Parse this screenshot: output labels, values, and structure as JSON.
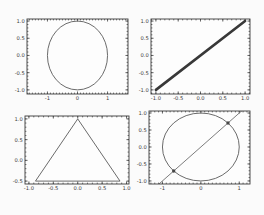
{
  "figure": {
    "width": 264,
    "height": 215,
    "background": "#fbfbfb",
    "axes_background": "#fdfdfd"
  },
  "style": {
    "spine_color": "#3b3b3b",
    "tick_color": "#3b3b3b",
    "tick_label_color": "#3a3a3a",
    "tick_font_size": 5.2,
    "major_tick_len": 2.6,
    "minor_tick_len": 1.4
  },
  "chart_data": [
    {
      "id": "top-left",
      "type": "line",
      "title": "",
      "xlabel": "",
      "ylabel": "",
      "box": {
        "left": 27,
        "top": 19,
        "width": 101,
        "height": 75
      },
      "xlim": [
        -1.68,
        1.68
      ],
      "ylim": [
        -1.12,
        1.06
      ],
      "xticks": {
        "values": [
          -1,
          0,
          1
        ],
        "labels": [
          "-1",
          "0",
          "1"
        ]
      },
      "yticks": {
        "values": [
          1.0,
          0.5,
          0.0,
          -0.5,
          -1.0
        ],
        "labels": [
          "1.0",
          "0.5",
          "0.0",
          "-0.5",
          "-1.0"
        ]
      },
      "minor_step": 0.1,
      "grid": false,
      "elements": [
        {
          "kind": "circle",
          "name": "unit-circle",
          "cx": 0,
          "cy": 0,
          "r": 1,
          "stroke": "#5a5a5a",
          "width": 0.9
        }
      ]
    },
    {
      "id": "top-right",
      "type": "line",
      "title": "",
      "xlabel": "",
      "ylabel": "",
      "box": {
        "left": 151,
        "top": 19,
        "width": 99,
        "height": 75
      },
      "xlim": [
        -1.11,
        1.11
      ],
      "ylim": [
        -1.12,
        1.06
      ],
      "xticks": {
        "values": [
          -1.0,
          -0.5,
          0.0,
          0.5,
          1.0
        ],
        "labels": [
          "-1.0",
          "-0.5",
          "0.0",
          "0.5",
          "1.0"
        ]
      },
      "yticks": {
        "values": [
          1.0,
          0.5,
          0.0,
          -0.5,
          -1.0
        ],
        "labels": [
          "1.0",
          "0.5",
          "0.0",
          "-0.5",
          "-1.0"
        ]
      },
      "minor_step": 0.1,
      "grid": false,
      "elements": [
        {
          "kind": "line",
          "name": "diagonal-line",
          "x1": -1,
          "y1": -1,
          "x2": 1,
          "y2": 1,
          "stroke": "#383838",
          "width": 2.6
        }
      ]
    },
    {
      "id": "bottom-left",
      "type": "line",
      "title": "",
      "xlabel": "",
      "ylabel": "",
      "box": {
        "left": 25,
        "top": 116,
        "width": 104,
        "height": 68
      },
      "xlim": [
        -1.08,
        1.05
      ],
      "ylim": [
        -0.57,
        1.07
      ],
      "xticks": {
        "values": [
          -1.0,
          -0.5,
          0.0,
          0.5,
          1.0
        ],
        "labels": [
          "-1.0",
          "-0.5",
          "0.0",
          "0.5",
          "1.0"
        ]
      },
      "yticks": {
        "values": [
          1.0,
          0.5,
          0.0,
          -0.5
        ],
        "labels": [
          "1.0",
          "0.5",
          "0.0",
          "-0.5"
        ]
      },
      "minor_step": 0.1,
      "grid": false,
      "elements": [
        {
          "kind": "polygon",
          "name": "triangle",
          "points": [
            [
              -0.866,
              -0.5
            ],
            [
              0.866,
              -0.5
            ],
            [
              0,
              1
            ]
          ],
          "stroke": "#5a5a5a",
          "width": 0.9
        }
      ]
    },
    {
      "id": "bottom-right",
      "type": "line",
      "title": "",
      "xlabel": "",
      "ylabel": "",
      "box": {
        "left": 149,
        "top": 111,
        "width": 101,
        "height": 73
      },
      "xlim": [
        -1.35,
        1.28
      ],
      "ylim": [
        -1.09,
        1.06
      ],
      "xticks": {
        "values": [
          -1,
          0,
          1
        ],
        "labels": [
          "-1",
          "0",
          "1"
        ]
      },
      "yticks": {
        "values": [
          1.0,
          0.5,
          0.0,
          -0.5,
          -1.0
        ],
        "labels": [
          "1.0",
          "0.5",
          "0.0",
          "-0.5",
          "-1.0"
        ]
      },
      "minor_step": 0.1,
      "grid": false,
      "elements": [
        {
          "kind": "circle",
          "name": "unit-circle",
          "cx": 0,
          "cy": 0,
          "r": 1,
          "stroke": "#5a5a5a",
          "width": 0.9
        },
        {
          "kind": "line",
          "name": "chord-line",
          "x1": -1.2,
          "y1": -1.2,
          "x2": 1.3,
          "y2": 1.3,
          "stroke": "#6e6e6e",
          "width": 0.9
        },
        {
          "kind": "points",
          "name": "intersection-points",
          "points": [
            [
              -0.707,
              -0.707
            ],
            [
              0.707,
              0.707
            ]
          ],
          "r": 1.7,
          "fill": "#464646"
        }
      ]
    }
  ]
}
